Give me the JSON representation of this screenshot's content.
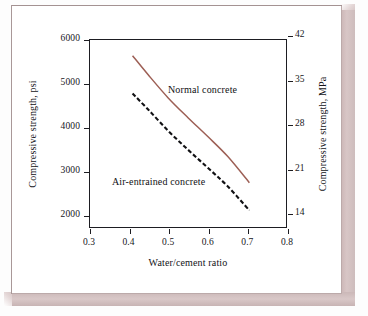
{
  "chart_data": {
    "type": "line",
    "title": "",
    "xlabel": "Water/cement ratio",
    "ylabel": "Compressive strength, psi",
    "ylabel_secondary": "Compressive strength, MPa",
    "xlim": [
      0.3,
      0.8
    ],
    "ylim": [
      1700,
      6000
    ],
    "ylim_secondary": [
      11.7,
      41.4
    ],
    "grid": false,
    "legend_position": "inline-annotations",
    "xticks": [
      "0.3",
      "0.4",
      "0.5",
      "0.6",
      "0.7",
      "0.8"
    ],
    "xtick_values": [
      0.3,
      0.4,
      0.5,
      0.6,
      0.7,
      0.8
    ],
    "yticks_left": [
      "2000",
      "3000",
      "4000",
      "5000",
      "6000"
    ],
    "ytick_values_left": [
      2000,
      3000,
      4000,
      5000,
      6000
    ],
    "yticks_right": [
      "14",
      "21",
      "28",
      "35",
      "42"
    ],
    "ytick_values_right": [
      14,
      21,
      28,
      35,
      42
    ],
    "series": [
      {
        "name": "Normal concrete",
        "style": "solid",
        "color": "#9d5f55",
        "x": [
          0.41,
          0.45,
          0.5,
          0.55,
          0.6,
          0.65,
          0.705
        ],
        "values": [
          5620,
          5180,
          4660,
          4210,
          3780,
          3330,
          2730
        ]
      },
      {
        "name": "Air-entrained concrete",
        "style": "dashed",
        "color": "#111114",
        "x": [
          0.41,
          0.45,
          0.5,
          0.55,
          0.6,
          0.65,
          0.705
        ],
        "values": [
          4760,
          4390,
          3910,
          3480,
          3070,
          2650,
          2100
        ]
      }
    ],
    "annotations": [
      {
        "text": "Normal concrete",
        "x": 0.545,
        "y": 4900
      },
      {
        "text": "Air-entrained concrete",
        "x": 0.455,
        "y": 2800
      }
    ]
  },
  "colors": {
    "normal_concrete": "#9d5f55",
    "air_entrained_concrete": "#111114",
    "axis": "#1d1d22",
    "frame_bevel": "#d4c2c2",
    "page": "#ffffff"
  }
}
